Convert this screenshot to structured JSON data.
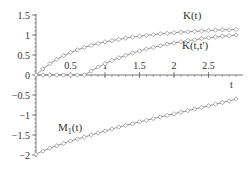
{
  "chart_data": {
    "type": "line",
    "title": "",
    "xlabel": "t",
    "ylabel": "",
    "xlim": [
      0,
      3
    ],
    "ylim": [
      -2,
      1.5
    ],
    "grid": false,
    "legend": "inline labels",
    "x_ticks": [
      0.5,
      1,
      1.5,
      2,
      2.5
    ],
    "x_tick_labels": [
      "0.5",
      "1",
      "1.5",
      "2",
      "2.5"
    ],
    "y_ticks": [
      1.5,
      1,
      0.5,
      0,
      -0.5,
      -1,
      -1.5,
      -2
    ],
    "y_tick_labels": [
      "1.5",
      "1",
      "0.5",
      "0",
      "-0.5",
      "-1",
      "-1.5",
      "-2"
    ],
    "marker": "diamond",
    "series": [
      {
        "name": "K(t)",
        "label": "K(t)",
        "x": [
          0,
          0.1,
          0.2,
          0.3,
          0.4,
          0.5,
          0.6,
          0.7,
          0.8,
          0.9,
          1.0,
          1.1,
          1.2,
          1.3,
          1.4,
          1.5,
          1.6,
          1.7,
          1.8,
          1.9,
          2.0,
          2.1,
          2.2,
          2.3,
          2.4,
          2.5,
          2.6,
          2.7,
          2.8,
          2.9
        ],
        "values": [
          0,
          0.15,
          0.28,
          0.39,
          0.48,
          0.56,
          0.63,
          0.69,
          0.74,
          0.79,
          0.83,
          0.86,
          0.89,
          0.92,
          0.95,
          0.97,
          0.99,
          1.01,
          1.03,
          1.04,
          1.06,
          1.07,
          1.08,
          1.09,
          1.1,
          1.11,
          1.12,
          1.13,
          1.13,
          1.14
        ]
      },
      {
        "name": "K(t,t')",
        "label": "K(t,t')",
        "x": [
          0,
          0.1,
          0.2,
          0.3,
          0.4,
          0.5,
          0.6,
          0.7,
          0.8,
          0.9,
          1.0,
          1.1,
          1.2,
          1.3,
          1.4,
          1.5,
          1.6,
          1.7,
          1.8,
          1.9,
          2.0,
          2.1,
          2.2,
          2.3,
          2.4,
          2.5,
          2.6,
          2.7,
          2.8,
          2.9
        ],
        "values": [
          0,
          0,
          0,
          0,
          0,
          0,
          0,
          0,
          0.1,
          0.2,
          0.28,
          0.36,
          0.43,
          0.49,
          0.55,
          0.6,
          0.65,
          0.69,
          0.73,
          0.77,
          0.8,
          0.83,
          0.86,
          0.88,
          0.91,
          0.93,
          0.95,
          0.97,
          0.98,
          1.0
        ]
      },
      {
        "name": "M1(t)",
        "label": "M",
        "label_sub": "1",
        "label_suffix": "(t)",
        "x": [
          0,
          0.1,
          0.2,
          0.3,
          0.4,
          0.5,
          0.6,
          0.7,
          0.8,
          0.9,
          1.0,
          1.1,
          1.2,
          1.3,
          1.4,
          1.5,
          1.6,
          1.7,
          1.8,
          1.9,
          2.0,
          2.1,
          2.2,
          2.3,
          2.4,
          2.5,
          2.6,
          2.7,
          2.8,
          2.9
        ],
        "values": [
          -1.98,
          -1.9,
          -1.83,
          -1.77,
          -1.71,
          -1.65,
          -1.6,
          -1.55,
          -1.5,
          -1.45,
          -1.4,
          -1.35,
          -1.3,
          -1.26,
          -1.22,
          -1.17,
          -1.13,
          -1.09,
          -1.05,
          -1.01,
          -0.97,
          -0.93,
          -0.89,
          -0.85,
          -0.81,
          -0.77,
          -0.73,
          -0.69,
          -0.65,
          -0.6
        ]
      }
    ]
  },
  "labels": {
    "x_axis": "t",
    "k_t": "K(t)",
    "k_tt": "K(t,t')",
    "m1_main": "M",
    "m1_sub": "1",
    "m1_suffix": "(t)"
  },
  "colors": {
    "axis": "#555555",
    "curve": "#777777",
    "marker": "#888888",
    "text": "#333333"
  }
}
